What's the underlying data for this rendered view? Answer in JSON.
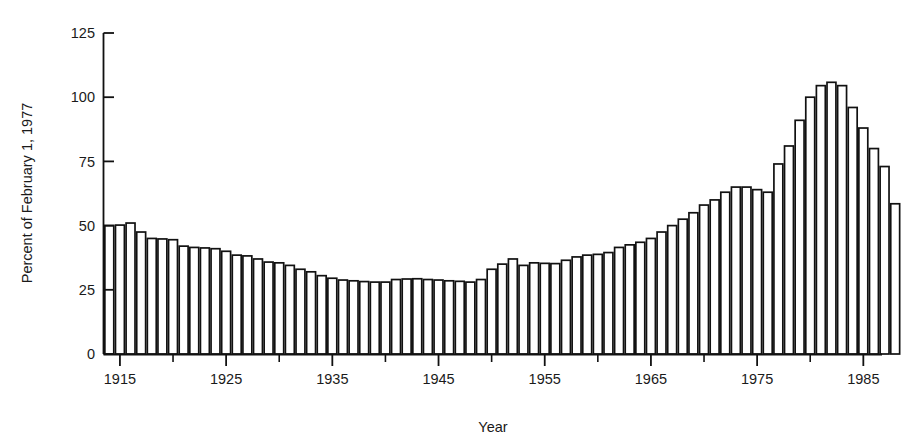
{
  "chart_data": {
    "type": "bar",
    "title": "",
    "subtitle": "",
    "xlabel": "Year",
    "ylabel": "Percent of February 1, 1977",
    "xlim": [
      1914,
      1986
    ],
    "ylim": [
      0,
      125
    ],
    "grid": false,
    "legend": null,
    "yticks": [
      0,
      25,
      50,
      75,
      100,
      125
    ],
    "ytick_labels": [
      "0",
      "25",
      "50",
      "75",
      "100",
      "125"
    ],
    "xticks_major": [
      1915,
      1925,
      1935,
      1945,
      1955,
      1965,
      1975,
      1985
    ],
    "xtick_labels": [
      "1915",
      "1925",
      "1935",
      "1945",
      "1955",
      "1965",
      "1975",
      "1985"
    ],
    "xticks_minor": [
      1920,
      1930,
      1940,
      1950,
      1960,
      1970,
      1980
    ],
    "categories": [
      1914,
      1915,
      1916,
      1917,
      1918,
      1919,
      1920,
      1921,
      1922,
      1923,
      1924,
      1925,
      1926,
      1927,
      1928,
      1929,
      1930,
      1931,
      1932,
      1933,
      1934,
      1935,
      1936,
      1937,
      1938,
      1939,
      1940,
      1941,
      1942,
      1943,
      1944,
      1945,
      1946,
      1947,
      1948,
      1949,
      1950,
      1951,
      1952,
      1953,
      1954,
      1955,
      1956,
      1957,
      1958,
      1959,
      1960,
      1961,
      1962,
      1963,
      1964,
      1965,
      1966,
      1967,
      1968,
      1969,
      1970,
      1971,
      1972,
      1973,
      1974,
      1975,
      1976,
      1977,
      1978,
      1979,
      1980,
      1981,
      1982,
      1983,
      1984,
      1985
    ],
    "values": [
      50.0,
      50.2,
      51.0,
      47.5,
      45.0,
      44.8,
      44.5,
      42.0,
      41.5,
      41.3,
      41.0,
      40.0,
      38.5,
      38.2,
      37.0,
      35.8,
      35.5,
      34.5,
      33.0,
      32.0,
      30.5,
      29.5,
      28.8,
      28.5,
      28.2,
      28.0,
      28.0,
      29.0,
      29.2,
      29.3,
      29.0,
      28.8,
      28.5,
      28.3,
      28.0,
      29.0,
      33.0,
      35.0,
      37.0,
      34.5,
      35.5,
      35.3,
      35.2,
      36.5,
      37.8,
      38.5,
      38.8,
      39.5,
      41.5,
      42.5,
      43.5,
      45.0,
      47.5,
      50.0,
      52.5,
      55.0,
      58.0,
      60.0,
      63.0,
      65.0,
      65.0,
      64.0,
      63.0,
      74.0,
      81.0,
      91.0,
      100.0,
      104.5,
      105.8,
      104.5,
      96.0,
      88.0
    ],
    "values_tail": [
      80.0,
      73.0,
      58.5
    ],
    "series": [
      {
        "name": "Percent of February 1, 1977",
        "values": [
          50.0,
          50.2,
          51.0,
          47.5,
          45.0,
          44.8,
          44.5,
          42.0,
          41.5,
          41.3,
          41.0,
          40.0,
          38.5,
          38.2,
          37.0,
          35.8,
          35.5,
          34.5,
          33.0,
          32.0,
          30.5,
          29.5,
          28.8,
          28.5,
          28.2,
          28.0,
          28.0,
          29.0,
          29.2,
          29.3,
          29.0,
          28.8,
          28.5,
          28.3,
          28.0,
          29.0,
          33.0,
          35.0,
          37.0,
          34.5,
          35.5,
          35.3,
          35.2,
          36.5,
          37.8,
          38.5,
          38.8,
          39.5,
          41.5,
          42.5,
          43.5,
          45.0,
          47.5,
          50.0,
          52.5,
          55.0,
          58.0,
          60.0,
          63.0,
          65.0,
          65.0,
          64.0,
          63.0,
          74.0,
          81.0,
          91.0,
          100.0,
          104.5,
          105.8,
          104.5,
          96.0,
          88.0
        ]
      }
    ],
    "colors": {
      "bar_fill": "#ffffff",
      "bar_stroke": "#111111",
      "axis": "#111111",
      "text": "#1a1a1a",
      "background": "#ffffff"
    }
  }
}
